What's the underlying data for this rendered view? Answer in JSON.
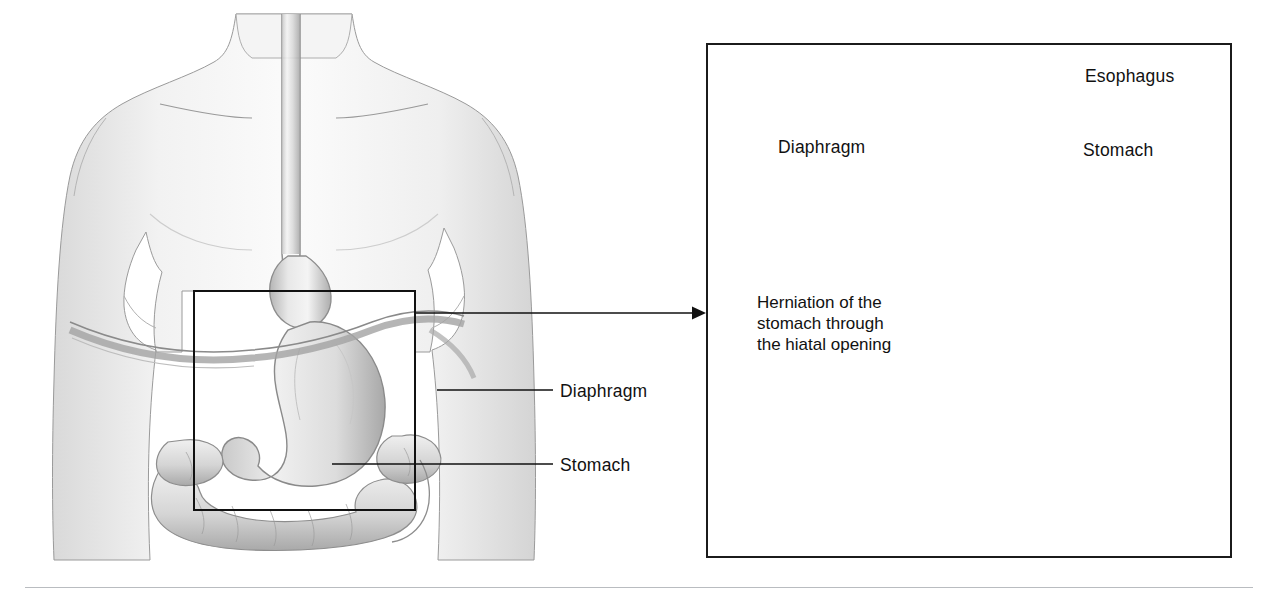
{
  "figure": {
    "type": "medical-anatomical-illustration",
    "background_color": "#ffffff",
    "ink_color": "#111111"
  },
  "overview_panel": {
    "name": "anterior torso with digestive tract",
    "description": "Pencil-shaded anterior view of a human torso showing neck, shoulders, esophagus descending the midline, stomach and surrounding large intestine",
    "detail_box": {
      "x": 194,
      "y": 291,
      "width": 221,
      "height": 219,
      "stroke": "#111111"
    },
    "labels": [
      {
        "id": "diaphragm",
        "text": "Diaphragm",
        "x": 560,
        "y": 381,
        "leader": {
          "x1": 437,
          "y1": 390,
          "x2": 553,
          "y2": 390
        }
      },
      {
        "id": "stomach",
        "text": "Stomach",
        "x": 560,
        "y": 455,
        "leader": {
          "x1": 332,
          "y1": 464,
          "x2": 553,
          "y2": 464
        }
      }
    ]
  },
  "connector": {
    "name": "magnification-arrow",
    "from_x": 415,
    "from_y": 313,
    "to_x": 700,
    "to_y": 313,
    "arrowhead": "right"
  },
  "detail_panel": {
    "name": "magnified hiatal hernia view",
    "frame": {
      "x": 706,
      "y": 43,
      "width": 526,
      "height": 515,
      "stroke": "#1b1b1b"
    },
    "description": "Close-up of the stomach herniating upward through the hiatal opening of the diaphragm, showing esophagus, gastric rugae and the diaphragm muscle band",
    "labels": [
      {
        "id": "esophagus",
        "text": "Esophagus",
        "x": 1085,
        "y": 66,
        "leader": {
          "x1": 982,
          "y1": 77,
          "x2": 1078,
          "y2": 77
        }
      },
      {
        "id": "stomach",
        "text": "Stomach",
        "x": 1083,
        "y": 140,
        "leader": {
          "x1": 990,
          "y1": 178,
          "x2": 1076,
          "y2": 152
        }
      },
      {
        "id": "diaphragm",
        "text": "Diaphragm",
        "x": 778,
        "y": 137,
        "leader": {
          "x1": 802,
          "y1": 160,
          "x2": 868,
          "y2": 202
        }
      }
    ],
    "caption": {
      "id": "herniation-caption",
      "lines": [
        "Herniation of the",
        "stomach through",
        "the hiatal opening"
      ],
      "x": 757,
      "y": 292
    }
  },
  "footer": {
    "rule": {
      "x": 25,
      "y": 587,
      "width": 1228,
      "color": "#b9bcc0"
    }
  }
}
